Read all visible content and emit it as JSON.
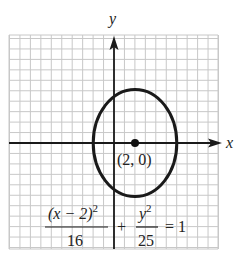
{
  "figure": {
    "type": "ellipse-graph",
    "axes": {
      "x_label": "x",
      "y_label": "y"
    },
    "grid": {
      "unit_px": 10.45,
      "color": "#c8c8c8"
    },
    "ellipse": {
      "center": [
        2,
        0
      ],
      "a_horizontal": 4,
      "b_vertical": 5,
      "stroke": "#1a1a1a"
    },
    "center_point": {
      "label": "(2, 0)"
    },
    "equation": {
      "term1_numerator": "(x − 2)",
      "term1_numerator_exp": "2",
      "term1_denominator": "16",
      "plus": "+",
      "term2_numerator": "y",
      "term2_numerator_exp": "2",
      "term2_denominator": "25",
      "equals": "= 1"
    }
  }
}
